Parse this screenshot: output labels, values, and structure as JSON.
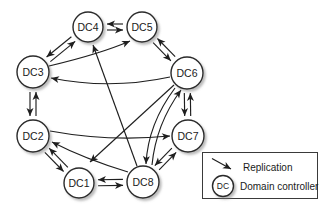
{
  "colors": {
    "line": "#1f1f1f",
    "node_fill": "#ffffff",
    "node_stroke": "#2b2b2b",
    "text": "#1a1a1a",
    "shadow": "#777777",
    "background": "#ffffff"
  },
  "nodes": [
    {
      "id": "DC1",
      "label": "DC1",
      "x": 79,
      "y": 183,
      "r": 15
    },
    {
      "id": "DC2",
      "label": "DC2",
      "x": 33,
      "y": 136,
      "r": 16
    },
    {
      "id": "DC3",
      "label": "DC3",
      "x": 33,
      "y": 72,
      "r": 16
    },
    {
      "id": "DC4",
      "label": "DC4",
      "x": 88,
      "y": 27,
      "r": 15
    },
    {
      "id": "DC5",
      "label": "DC5",
      "x": 142,
      "y": 27,
      "r": 15
    },
    {
      "id": "DC6",
      "label": "DC6",
      "x": 187,
      "y": 73,
      "r": 16
    },
    {
      "id": "DC7",
      "label": "DC7",
      "x": 188,
      "y": 136,
      "r": 16
    },
    {
      "id": "DC8",
      "label": "DC8",
      "x": 143,
      "y": 182,
      "r": 16
    }
  ],
  "edges": [
    {
      "type": "pair",
      "a": "DC4",
      "b": "DC5"
    },
    {
      "type": "pair",
      "a": "DC3",
      "b": "DC4"
    },
    {
      "type": "pair",
      "a": "DC5",
      "b": "DC6"
    },
    {
      "type": "pair",
      "a": "DC2",
      "b": "DC3"
    },
    {
      "type": "pair",
      "a": "DC6",
      "b": "DC7"
    },
    {
      "type": "pair",
      "a": "DC1",
      "b": "DC2"
    },
    {
      "type": "pair",
      "a": "DC7",
      "b": "DC8"
    },
    {
      "type": "pair",
      "a": "DC8",
      "b": "DC1"
    },
    {
      "type": "arrow",
      "from": "DC6",
      "to": "DC3",
      "path": "M 170,77 Q 110,90 51,78"
    },
    {
      "type": "arrow",
      "from": "DC3",
      "to": "DC5",
      "path": "M 49,66 Q 100,54 130,41"
    },
    {
      "type": "arrow",
      "from": "DC8",
      "to": "DC4",
      "path": "M 137,166 L 93,45"
    },
    {
      "type": "arrow",
      "from": "DC6",
      "to": "DC8",
      "path": "M 175,88 Q 148,124 146,164"
    },
    {
      "type": "arrow",
      "from": "DC8",
      "to": "DC6",
      "path": "M 152,165 Q 156,124 181,90"
    },
    {
      "type": "arrow",
      "from": "DC2",
      "to": "DC7",
      "path": "M 50,131 Q 110,142 170,136"
    },
    {
      "type": "arrow",
      "from": "DC8",
      "to": "DC2",
      "path": "M 128,172 Q 85,159 52,142"
    },
    {
      "type": "arrow",
      "from": "DC6",
      "to": "DC1",
      "path": "M 174,85 L 90,162"
    }
  ],
  "legend": {
    "replication_label": "Replication",
    "dc_symbol": "DC",
    "dc_label": "Domain controller"
  }
}
